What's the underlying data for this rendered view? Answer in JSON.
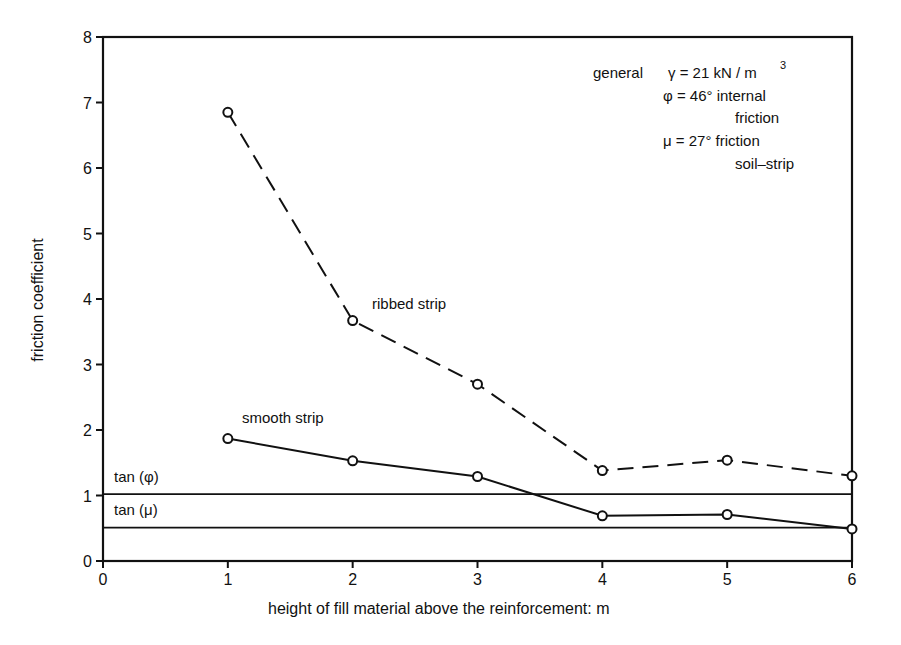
{
  "chart_data": {
    "type": "line",
    "title": "",
    "xlabel": "height of fill material above the reinforcement: m",
    "ylabel": "friction coefficient",
    "xlim": [
      0,
      6
    ],
    "ylim": [
      0,
      8
    ],
    "x_ticks": [
      "0",
      "1",
      "2",
      "3",
      "4",
      "5",
      "6"
    ],
    "y_ticks": [
      "0",
      "1",
      "2",
      "3",
      "4",
      "5",
      "6",
      "7",
      "8"
    ],
    "grid": false,
    "x": [
      1,
      2,
      3,
      4,
      5,
      6
    ],
    "series": [
      {
        "name": "ribbed strip",
        "style": "dashed",
        "marker": "open-circle",
        "values": [
          6.85,
          3.67,
          2.7,
          1.38,
          1.54,
          1.3
        ]
      },
      {
        "name": "smooth strip",
        "style": "solid",
        "marker": "open-circle",
        "values": [
          1.87,
          1.53,
          1.29,
          0.69,
          0.71,
          0.49
        ]
      }
    ],
    "reference_lines": [
      {
        "name": "tan (φ)",
        "value": 1.02
      },
      {
        "name": "tan (μ)",
        "value": 0.51
      }
    ],
    "annotations": {
      "line1_label": "general",
      "line1": "γ = 21 kN / m",
      "line1_sup": "3",
      "line2": "φ = 46° internal",
      "line3": "friction",
      "line4": "μ = 27° friction",
      "line5": "soil–strip"
    },
    "series_labels": {
      "ribbed": "ribbed strip",
      "smooth": "smooth strip",
      "tan_phi": "tan (φ)",
      "tan_mu": "tan (μ)"
    }
  }
}
